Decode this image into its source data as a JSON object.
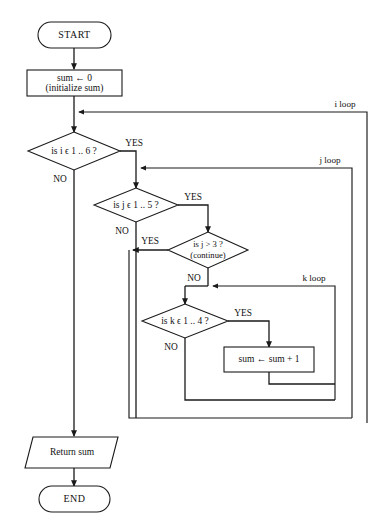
{
  "diagram": {
    "nodes": {
      "start": {
        "label": "START",
        "shape": "terminator"
      },
      "init": {
        "line1": "sum  ← 0",
        "line2": "(initialize sum)",
        "shape": "process"
      },
      "cond_i": {
        "label": "is i ϵ 1 .. 6 ?",
        "shape": "decision"
      },
      "cond_j": {
        "label": "is j ϵ 1 .. 5 ?",
        "shape": "decision"
      },
      "cond_continue": {
        "line1": "is j > 3 ?",
        "line2": "(continue)",
        "shape": "decision"
      },
      "cond_k": {
        "label": "is k ϵ  1 .. 4 ?",
        "shape": "decision"
      },
      "accumulate": {
        "label": "sum  ← sum + 1",
        "shape": "process"
      },
      "return": {
        "label": "Return sum",
        "shape": "io"
      },
      "end": {
        "label": "END",
        "shape": "terminator"
      }
    },
    "branch_labels": {
      "i_yes": "YES",
      "i_no": "NO",
      "j_yes": "YES",
      "j_no": "NO",
      "continue_yes": "YES",
      "continue_no": "NO",
      "k_yes": "YES",
      "k_no": "NO"
    },
    "loop_labels": {
      "i_loop": "i loop",
      "j_loop": "j loop",
      "k_loop": "k loop"
    },
    "colors": {
      "stroke": "#1a1a1a",
      "fill": "#ffffff",
      "text": "#111111"
    }
  }
}
